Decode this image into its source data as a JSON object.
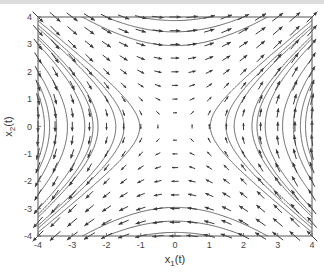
{
  "chart_data": {
    "type": "quiver",
    "title": "",
    "xlabel": "x1(t)",
    "ylabel": "x2(t)",
    "xlabel_main": "x",
    "xlabel_sub": "1",
    "xlabel_tail": "(t)",
    "ylabel_main": "x",
    "ylabel_sub": "2",
    "ylabel_tail": "(t)",
    "xlim": [
      -4,
      4
    ],
    "ylim": [
      -4,
      4
    ],
    "xticks": [
      -4,
      -3,
      -2,
      -1,
      0,
      1,
      2,
      3,
      4
    ],
    "yticks": [
      -4,
      -3,
      -2,
      -1,
      0,
      1,
      2,
      3,
      4
    ],
    "grid": false,
    "legend": null,
    "vector_field": {
      "description": "saddle-type phase portrait; flow right at top, up at right, left at bottom, down at left",
      "dx1_dt": "x2",
      "dx2_dt": "x1",
      "quiver_step": 0.5,
      "equilibrium": [
        0,
        0
      ],
      "equilibrium_type": "saddle"
    },
    "streamline_seeds": [
      [
        -4,
        3.6
      ],
      [
        -4,
        3.3
      ],
      [
        -4,
        3.0
      ],
      [
        -4,
        2.0
      ],
      [
        -4,
        1.2
      ],
      [
        -3.8,
        1.0
      ],
      [
        -3.3,
        1.0
      ],
      [
        -2.6,
        1.0
      ],
      [
        -1.8,
        1.0
      ],
      [
        -1.2,
        0.6
      ],
      [
        4,
        -3.6
      ],
      [
        4,
        -3.3
      ],
      [
        4,
        -3.0
      ],
      [
        4,
        -2.0
      ],
      [
        4,
        -1.2
      ],
      [
        3.8,
        -1.0
      ],
      [
        3.3,
        -1.0
      ],
      [
        2.6,
        -1.0
      ],
      [
        1.8,
        -1.0
      ],
      [
        1.2,
        -0.6
      ],
      [
        -1.0,
        -4.0
      ],
      [
        -2.0,
        -4.0
      ],
      [
        1.0,
        4.0
      ],
      [
        2.0,
        4.0
      ],
      [
        0.5,
        3.0
      ],
      [
        -0.5,
        -3.0
      ]
    ],
    "colors": {
      "arrows": "#3a3a3a",
      "streamlines": "#555555",
      "axes": "#555555"
    }
  }
}
